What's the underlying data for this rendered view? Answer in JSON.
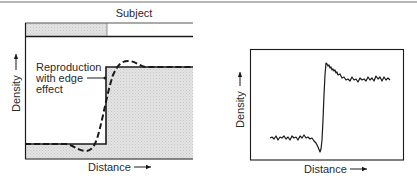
{
  "left_panel": {
    "subject_label": "Subject",
    "annotation": {
      "line1": "Reproduction",
      "line2": "with edge",
      "line3": "effect"
    },
    "ylabel": "Density",
    "xlabel": "Distance"
  },
  "right_panel": {
    "ylabel": "Density",
    "xlabel": "Distance"
  },
  "colors": {
    "ink": "#1a1a1a",
    "shade": "#dcdcdc",
    "subject_shade": "#d9d9d9",
    "rule": "#6e6e6e"
  }
}
